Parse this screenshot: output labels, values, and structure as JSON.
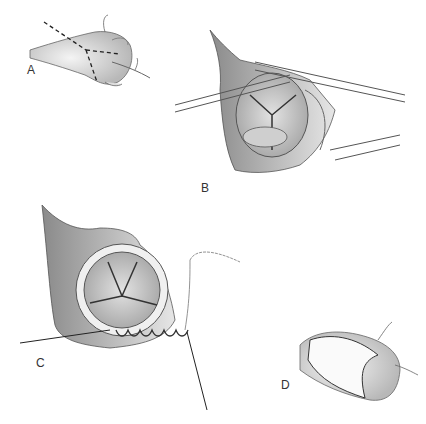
{
  "figure": {
    "panels": [
      {
        "id": "A",
        "label": "A",
        "description": "Heart/aorta with dashed incision lines"
      },
      {
        "id": "B",
        "label": "B",
        "description": "Aortotomy retracted exposing tricuspid aortic valve"
      },
      {
        "id": "C",
        "label": "C",
        "description": "Aortic valve exposed with annular sutures and traction lines"
      },
      {
        "id": "D",
        "label": "D",
        "description": "Closed aortotomy with running sutures"
      }
    ],
    "colors": {
      "background": "#ffffff",
      "tissue_shade": "#bdbdbd",
      "tissue_dark": "#7a7a7a",
      "line": "#444444",
      "label": "#333333"
    }
  }
}
